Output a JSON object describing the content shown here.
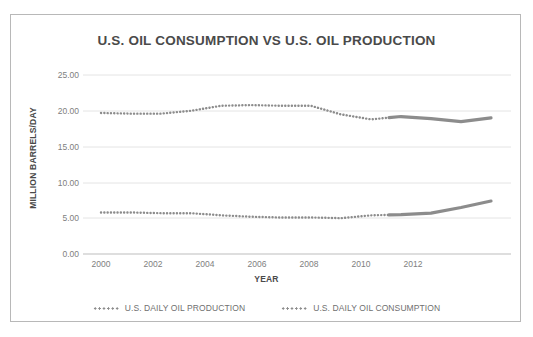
{
  "chart_data": {
    "type": "line",
    "title": "U.S. OIL CONSUMPTION VS U.S. OIL PRODUCTION",
    "xlabel": "YEAR",
    "ylabel": "MILLION BARRELS/DAY",
    "xlim": [
      2000,
      2013
    ],
    "ylim": [
      0.0,
      25.0
    ],
    "yticks": [
      "0.00",
      "5.00",
      "10.00",
      "15.00",
      "20.00",
      "25.00"
    ],
    "ytick_values": [
      0,
      5,
      10,
      15,
      20,
      25
    ],
    "xticks": [
      "2000",
      "2002",
      "2004",
      "2006",
      "2008",
      "2010",
      "2012"
    ],
    "xtick_values": [
      2000,
      2002,
      2004,
      2006,
      2008,
      2010,
      2012
    ],
    "grid": "horizontal",
    "legend_position": "bottom",
    "x": [
      2000,
      2001,
      2002,
      2003,
      2004,
      2005,
      2006,
      2007,
      2008,
      2009,
      2010,
      2011,
      2012,
      2013
    ],
    "series": [
      {
        "name": "U.S. DAILY OIL CONSUMPTION",
        "color": "#8c8c8c",
        "style": "dotted",
        "values": [
          19.7,
          19.6,
          19.6,
          20.0,
          20.7,
          20.8,
          20.7,
          20.7,
          19.5,
          18.8,
          19.2,
          18.9,
          18.5,
          19.0
        ]
      },
      {
        "name": "U.S. DAILY OIL PRODUCTION",
        "color": "#8c8c8c",
        "style": "dotted",
        "values": [
          5.8,
          5.8,
          5.7,
          5.7,
          5.4,
          5.2,
          5.1,
          5.1,
          5.0,
          5.4,
          5.5,
          5.7,
          6.5,
          7.4
        ]
      }
    ],
    "solid_segment_start_year": 2009.6,
    "legend": [
      {
        "label": "U.S. DAILY OIL PRODUCTION",
        "marker": "dotted-line"
      },
      {
        "label": "U.S. DAILY OIL CONSUMPTION",
        "marker": "dotted-line"
      }
    ]
  }
}
